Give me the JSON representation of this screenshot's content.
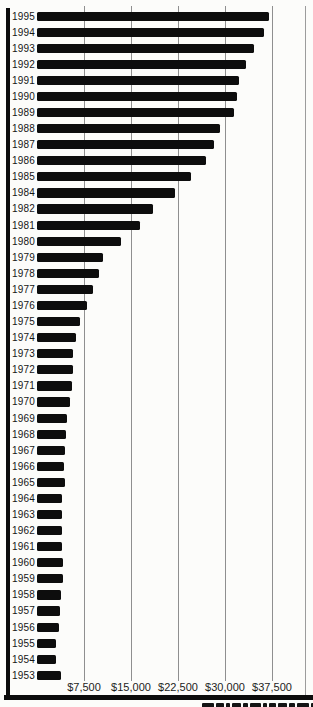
{
  "chart_data": {
    "type": "bar",
    "orientation": "horizontal",
    "title": "",
    "xlabel": "",
    "ylabel": "",
    "categories": [
      "1995",
      "1994",
      "1993",
      "1992",
      "1991",
      "1990",
      "1989",
      "1988",
      "1987",
      "1986",
      "1985",
      "1984",
      "1982",
      "1981",
      "1980",
      "1979",
      "1978",
      "1977",
      "1976",
      "1975",
      "1974",
      "1973",
      "1972",
      "1971",
      "1970",
      "1969",
      "1968",
      "1967",
      "1966",
      "1965",
      "1964",
      "1963",
      "1962",
      "1961",
      "1960",
      "1959",
      "1958",
      "1957",
      "1956",
      "1955",
      "1954",
      "1953"
    ],
    "values": [
      37100,
      36300,
      34600,
      33400,
      32300,
      31900,
      31500,
      29200,
      28200,
      27000,
      24500,
      22000,
      18500,
      16500,
      13400,
      10600,
      9900,
      9000,
      7900,
      6800,
      6200,
      5800,
      5800,
      5600,
      5200,
      4800,
      4700,
      4400,
      4250,
      4400,
      4000,
      4050,
      4000,
      4000,
      4150,
      4200,
      3800,
      3600,
      3500,
      3100,
      3100,
      3900
    ],
    "x_ticks": [
      "$7,500",
      "$15,000",
      "$22,500",
      "$30,000",
      "$37,500"
    ],
    "x_tick_values": [
      7500,
      15000,
      22500,
      30000,
      37500
    ],
    "xlim": [
      0,
      40000
    ],
    "grid": true,
    "legend": "none",
    "bar_color": "#0d0d0d",
    "gridline_color": "#8f8f8f"
  }
}
